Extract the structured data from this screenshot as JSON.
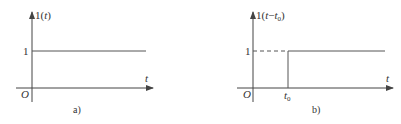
{
  "figure_a": {
    "y_label_main": "1(",
    "y_label_var": "t",
    "y_label_close": ")",
    "level_label": "1",
    "x_axis_label": "t",
    "origin_label": "O",
    "caption": "a)"
  },
  "figure_b": {
    "y_label_main": "1(",
    "y_label_var": "t",
    "y_label_minus": "−",
    "y_label_var2": "t",
    "y_label_sub": "0",
    "y_label_close": ")",
    "level_label": "1",
    "x_axis_label": "t",
    "origin_label": "O",
    "step_label": "t",
    "step_label_sub": "0",
    "caption": "b)"
  },
  "colors": {
    "line": "#444444",
    "text": "#333333"
  }
}
